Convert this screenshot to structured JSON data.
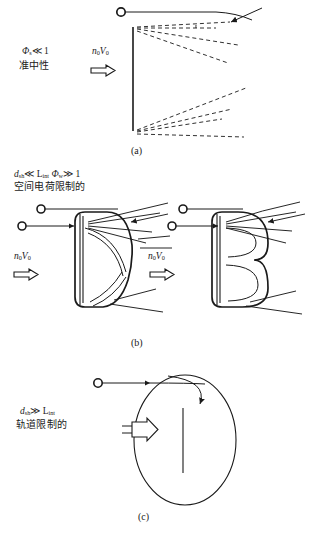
{
  "figure": {
    "type": "scientific-diagram",
    "background_color": "#ffffff",
    "line_color": "#1a1a1a"
  },
  "panels": [
    {
      "id": "a",
      "caption": "(a)",
      "condition_math": "Φ",
      "condition_sub": "s",
      "condition_rel": "≪ 1",
      "condition_label": "准中性",
      "flow_symbol": "n",
      "flow_sub1": "0",
      "flow_symbol2": "V",
      "flow_sub2": "0",
      "shape": "vertical-plate",
      "ray_style": "dashed",
      "ray_count_upper": 4,
      "ray_count_lower": 4
    },
    {
      "id": "b",
      "caption": "(b)",
      "condition_math": "d",
      "condition_sub": "sh",
      "condition_rel": "≪ L",
      "condition_sub2": "int",
      "condition_math2": "Φ",
      "condition_sub3": "w",
      "condition_rel2": "≫ 1",
      "condition_label": "空间电荷限制的",
      "flow_symbol": "n",
      "flow_sub1": "0",
      "flow_symbol2": "V",
      "flow_sub2": "0",
      "shape_left": "D-shaped-sheath",
      "shape_right": "B-shaped-sheath",
      "ray_style": "solid"
    },
    {
      "id": "c",
      "caption": "(c)",
      "condition_math": "d",
      "condition_sub": "sh",
      "condition_rel": "≫ L",
      "condition_sub2": "int",
      "condition_label": "轨道限制的",
      "shape": "large-oval-sheath",
      "ray_style": "solid",
      "has_orbit_arrow": true
    }
  ],
  "labels": {
    "panel_a_caption": "(a)",
    "panel_b_caption": "(b)",
    "panel_c_caption": "(c)",
    "quasi_neutral": "准中性",
    "space_charge_limited": "空间电荷限制的",
    "orbit_limited": "轨道限制的"
  },
  "symbols": {
    "phi": "Φ",
    "much_less": "≪",
    "much_greater": "≫",
    "n": "n",
    "V": "V",
    "d": "d",
    "L": "L",
    "zero": "0",
    "s": "s",
    "w": "w",
    "sh": "sh",
    "int": "int",
    "one": "1"
  }
}
